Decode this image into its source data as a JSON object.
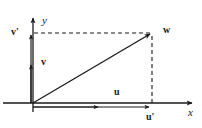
{
  "figure": {
    "background_color": "#ffffff",
    "stroke_color": "#1a1a1a",
    "width": 202,
    "height": 128
  },
  "axes": {
    "x_label": "x",
    "y_label": "y",
    "origin": {
      "x": 33,
      "y": 103
    },
    "x_axis": {
      "start_x": 3,
      "end_x": 196,
      "y": 103,
      "arrow": "right"
    },
    "y_axis": {
      "x": 33,
      "start_y": 112,
      "end_y": 14,
      "arrow": "up"
    }
  },
  "vectors": [
    {
      "name": "w",
      "label": "w",
      "kind": "resultant",
      "from": {
        "x": 33,
        "y": 103
      },
      "to": {
        "x": 152,
        "y": 33
      },
      "style": "solid",
      "arrow": true
    },
    {
      "name": "v",
      "label": "v",
      "kind": "component-vertical",
      "from": {
        "x": 31,
        "y": 103
      },
      "to": {
        "x": 31,
        "y": 63
      },
      "style": "solid",
      "arrow": true
    },
    {
      "name": "v-prime",
      "label": "v'",
      "kind": "component-vertical-scaled",
      "from": {
        "x": 31,
        "y": 103
      },
      "to": {
        "x": 31,
        "y": 33
      },
      "style": "solid",
      "arrow": true
    },
    {
      "name": "u",
      "label": "u",
      "kind": "component-horizontal",
      "from": {
        "x": 33,
        "y": 107
      },
      "to": {
        "x": 100,
        "y": 107
      },
      "style": "solid",
      "arrow": true
    },
    {
      "name": "u-prime",
      "label": "u'",
      "kind": "component-horizontal-scaled",
      "from": {
        "x": 33,
        "y": 107
      },
      "to": {
        "x": 152,
        "y": 107
      },
      "style": "solid",
      "arrow": true
    }
  ],
  "guides": [
    {
      "name": "horizontal-projection",
      "from": {
        "x": 33,
        "y": 33
      },
      "to": {
        "x": 150,
        "y": 33
      },
      "style": "dashed"
    },
    {
      "name": "vertical-projection",
      "from": {
        "x": 152,
        "y": 35
      },
      "to": {
        "x": 152,
        "y": 103
      },
      "style": "dashed"
    }
  ]
}
